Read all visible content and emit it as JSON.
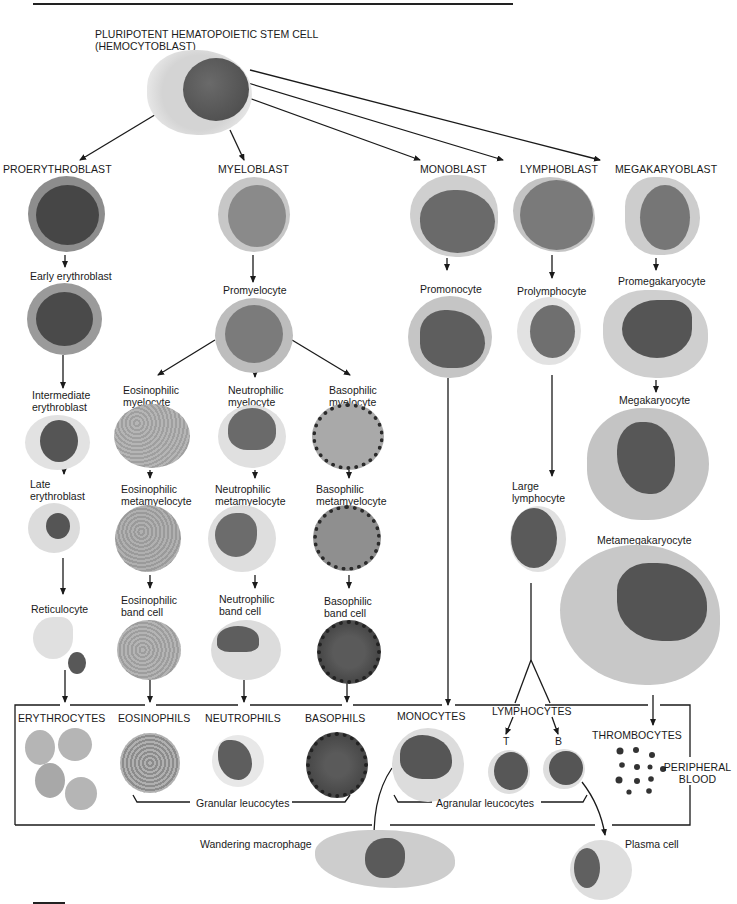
{
  "figure": {
    "type": "hematopoiesis-lineage-diagram",
    "stem_cell": {
      "line1": "PLURIPOTENT HEMATOPOIETIC STEM CELL",
      "line2": "(HEMOCYTOBLAST)"
    },
    "blasts": {
      "proerythroblast": "PROERYTHROBLAST",
      "myeloblast": "MYELOBLAST",
      "monoblast": "MONOBLAST",
      "lymphoblast": "LYMPHOBLAST",
      "megakaryoblast": "MEGAKARYOBLAST"
    },
    "erythroid": {
      "early": "Early erythroblast",
      "intermediate_1": "Intermediate",
      "intermediate_2": "erythroblast",
      "late_1": "Late",
      "late_2": "erythroblast",
      "reticulocyte": "Reticulocyte"
    },
    "myeloid": {
      "promyelocyte": "Promyelocyte",
      "eos_myelocyte_1": "Eosinophilic",
      "eos_myelocyte_2": "myelocyte",
      "neu_myelocyte_1": "Neutrophilic",
      "neu_myelocyte_2": "myelocyte",
      "bas_myelocyte_1": "Basophilic",
      "bas_myelocyte_2": "myelocyte",
      "eos_meta_1": "Eosinophilic",
      "eos_meta_2": "metamyelocyte",
      "neu_meta_1": "Neutrophilic",
      "neu_meta_2": "metamyelocyte",
      "bas_meta_1": "Basophilic",
      "bas_meta_2": "metamyelocyte",
      "eos_band_1": "Eosinophilic",
      "eos_band_2": "band cell",
      "neu_band_1": "Neutrophilic",
      "neu_band_2": "band cell",
      "bas_band_1": "Basophilic",
      "bas_band_2": "band cell"
    },
    "monocytic": {
      "promonocyte": "Promonocyte"
    },
    "lymphoid": {
      "prolymphocyte": "Prolymphocyte",
      "large_1": "Large",
      "large_2": "lymphocyte"
    },
    "megakaryocytic": {
      "promegakaryocyte": "Promegakaryocyte",
      "megakaryocyte": "Megakaryocyte",
      "metamegakaryocyte": "Metamegakaryocyte"
    },
    "peripheral_blood": {
      "erythrocytes": "ERYTHROCYTES",
      "eosinophils": "EOSINOPHILS",
      "neutrophils": "NEUTROPHILS",
      "basophils": "BASOPHILS",
      "monocytes": "MONOCYTES",
      "lymphocytes": "LYMPHOCYTES",
      "t_cell": "T",
      "b_cell": "B",
      "thrombocytes": "THROMBOCYTES",
      "box_label_1": "PERIPHERAL",
      "box_label_2": "BLOOD",
      "granular": "Granular leucocytes",
      "agranular": "Agranular leucocytes"
    },
    "tissue": {
      "macrophage": "Wandering macrophage",
      "plasma": "Plasma cell"
    },
    "colors": {
      "line": "#1a1a1a",
      "cytoplasm_light": "#d9d9d9",
      "cytoplasm_mid": "#a9a9a9",
      "nucleus": "#555555",
      "nucleus_dark": "#3f3f3f",
      "granule": "#2b2b2b"
    }
  }
}
